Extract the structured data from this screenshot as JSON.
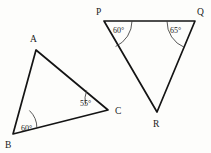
{
  "figure": {
    "background_color": "#fdfdfb",
    "stroke_color": "#141414",
    "triangles": [
      {
        "name": "triangle-abc",
        "vertices": [
          {
            "label": "A",
            "x": 36,
            "y": 50,
            "label_x": 30,
            "label_y": 42
          },
          {
            "label": "B",
            "x": 13,
            "y": 134,
            "label_x": 5,
            "label_y": 148
          },
          {
            "label": "C",
            "x": 108,
            "y": 110,
            "label_x": 115,
            "label_y": 114
          }
        ],
        "angles": [
          {
            "at": "B",
            "value": "60°",
            "label_x": 21,
            "label_y": 131
          },
          {
            "at": "C",
            "value": "55°",
            "label_x": 80,
            "label_y": 106
          }
        ]
      },
      {
        "name": "triangle-pqr",
        "vertices": [
          {
            "label": "P",
            "x": 104,
            "y": 21,
            "label_x": 96,
            "label_y": 15
          },
          {
            "label": "Q",
            "x": 195,
            "y": 21,
            "label_x": 197,
            "label_y": 15
          },
          {
            "label": "R",
            "x": 157,
            "y": 112,
            "label_x": 153,
            "label_y": 127
          }
        ],
        "angles": [
          {
            "at": "P",
            "value": "60°",
            "label_x": 113,
            "label_y": 33
          },
          {
            "at": "Q",
            "value": "65°",
            "label_x": 170,
            "label_y": 33
          }
        ]
      }
    ]
  }
}
